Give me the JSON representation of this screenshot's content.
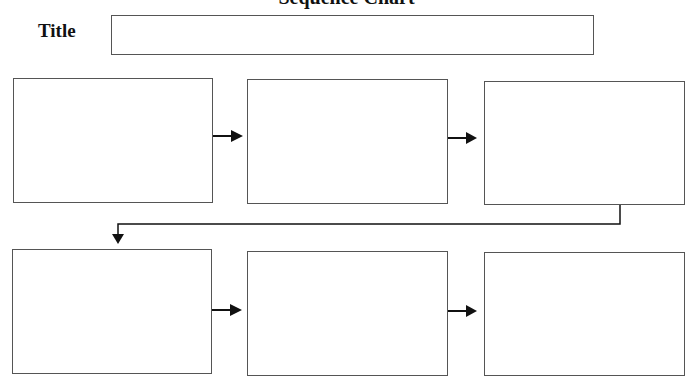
{
  "header": {
    "cut_off_heading": "Sequence Chart",
    "title_label": "Title",
    "title_value": ""
  },
  "rows": [
    {
      "boxes": [
        {
          "id": 1,
          "text": ""
        },
        {
          "id": 2,
          "text": ""
        },
        {
          "id": 3,
          "text": ""
        }
      ]
    },
    {
      "boxes": [
        {
          "id": 4,
          "text": ""
        },
        {
          "id": 5,
          "text": ""
        },
        {
          "id": 6,
          "text": ""
        }
      ]
    }
  ],
  "colors": {
    "stroke": "#555555",
    "arrow": "#111111",
    "background": "#ffffff"
  }
}
